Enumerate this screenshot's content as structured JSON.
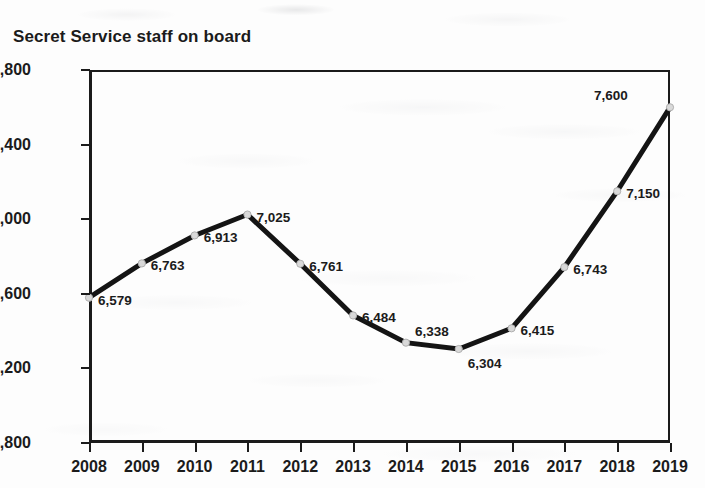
{
  "chart_data": {
    "type": "line",
    "title": "Secret Service staff on board",
    "xlabel": "",
    "ylabel": "",
    "categories": [
      "2008",
      "2009",
      "2010",
      "2011",
      "2012",
      "2013",
      "2014",
      "2015",
      "2016",
      "2017",
      "2018",
      "2019"
    ],
    "values": [
      6579,
      6763,
      6913,
      7025,
      6761,
      6484,
      6338,
      6304,
      6415,
      6743,
      7150,
      7600
    ],
    "point_labels": [
      "6,579",
      "6,763",
      "6,913",
      "7,025",
      "6,761",
      "6,484",
      "6,338",
      "6,304",
      "6,415",
      "6,743",
      "7,150",
      "7,600"
    ],
    "label_placements": [
      "right",
      "right",
      "right",
      "right",
      "right",
      "right",
      "above-right",
      "below-right",
      "right",
      "right",
      "right",
      "left"
    ],
    "ylim": [
      5800,
      7800
    ],
    "yticks": [
      5800,
      6200,
      6600,
      7000,
      7400,
      7800
    ],
    "ytick_labels": [
      "5,800",
      "6,200",
      "6,600",
      "7,000",
      "7,400",
      "7,800"
    ],
    "grid": false,
    "legend": "none",
    "line_color": "#141414",
    "marker_color": "#d9d9d9",
    "marker_edge_color": "#b0b0b0",
    "axis_color": "#1b1b1b",
    "background_color": "#fdfdfd"
  }
}
